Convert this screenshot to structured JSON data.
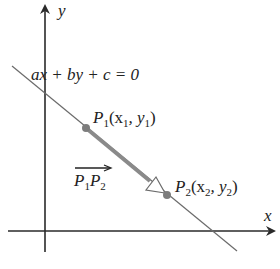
{
  "axes": {
    "x_label": "x",
    "y_label": "y"
  },
  "line": {
    "equation": "ax + by + c = 0"
  },
  "points": [
    {
      "name": "P",
      "sub": "1",
      "coords_open": "(x",
      "coords_sub1": "1",
      "coords_mid": ", y",
      "coords_sub2": "1",
      "coords_close": ")"
    },
    {
      "name": "P",
      "sub": "2",
      "coords_open": "(x",
      "coords_sub1": "2",
      "coords_mid": ", y",
      "coords_sub2": "2",
      "coords_close": ")"
    }
  ],
  "vector": {
    "from": "P",
    "from_sub": "1",
    "to": "P",
    "to_sub": "2"
  },
  "colors": {
    "axis": "#2a2a2a",
    "line": "#6b6b6b",
    "vector": "#8a8a8a",
    "point": "#7d7d7d"
  }
}
